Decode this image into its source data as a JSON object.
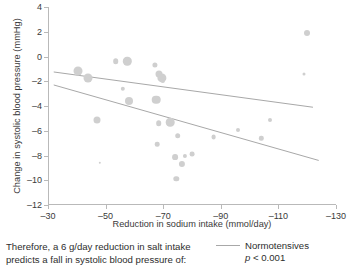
{
  "chart_data": {
    "type": "scatter",
    "title": "",
    "xlabel": "Reduction in sodium intake (mmol/day)",
    "ylabel": "Change in systolic blood pressure (mmHg)",
    "xlim": [
      -30,
      -130
    ],
    "ylim": [
      -12,
      4
    ],
    "x_ticks": [
      -30,
      -50,
      -70,
      -90,
      -110,
      -130
    ],
    "y_ticks": [
      4,
      2,
      0,
      -2,
      -4,
      -6,
      -8,
      -10,
      -12
    ],
    "x_tick_labels": [
      "–30",
      "–50",
      "–70",
      "–90",
      "–110",
      "–130"
    ],
    "y_tick_labels": [
      "4",
      "2",
      "0",
      "–2",
      "–4",
      "–6",
      "–8",
      "–10",
      "–12"
    ],
    "grid": false,
    "legend_position": "bottom-right",
    "marker_color": "#cfcfcf",
    "line_color": "#a8a8a8",
    "axis_color": "#b9b9b9",
    "points": [
      {
        "x": -40.5,
        "y": -1.2,
        "size": 9.0
      },
      {
        "x": -44.0,
        "y": -1.7,
        "size": 9.0
      },
      {
        "x": -47.0,
        "y": -5.1,
        "size": 7.0
      },
      {
        "x": -48.0,
        "y": -8.6,
        "size": 2.4
      },
      {
        "x": -53.5,
        "y": -0.4,
        "size": 5.6
      },
      {
        "x": -56.0,
        "y": -2.6,
        "size": 4.4
      },
      {
        "x": -57.5,
        "y": -0.4,
        "size": 8.4
      },
      {
        "x": -58.0,
        "y": -3.6,
        "size": 8.0
      },
      {
        "x": -67.5,
        "y": -3.5,
        "size": 8.6
      },
      {
        "x": -67.0,
        "y": -0.7,
        "size": 5.2
      },
      {
        "x": -68.5,
        "y": -1.4,
        "size": 7.0
      },
      {
        "x": -69.5,
        "y": -1.7,
        "size": 9.2
      },
      {
        "x": -70.0,
        "y": -2.0,
        "size": 4.2
      },
      {
        "x": -68.5,
        "y": -5.4,
        "size": 5.6
      },
      {
        "x": -68.0,
        "y": -7.1,
        "size": 4.6
      },
      {
        "x": -72.5,
        "y": -5.3,
        "size": 8.6
      },
      {
        "x": -75.0,
        "y": -6.4,
        "size": 5.6
      },
      {
        "x": -74.0,
        "y": -8.1,
        "size": 5.8
      },
      {
        "x": -76.5,
        "y": -8.7,
        "size": 6.2
      },
      {
        "x": -77.5,
        "y": -8.0,
        "size": 4.2
      },
      {
        "x": -80.0,
        "y": -7.9,
        "size": 4.8
      },
      {
        "x": -74.5,
        "y": -9.9,
        "size": 5.4
      },
      {
        "x": -87.5,
        "y": -6.5,
        "size": 4.8
      },
      {
        "x": -96.0,
        "y": -5.9,
        "size": 4.0
      },
      {
        "x": -104.0,
        "y": -6.6,
        "size": 4.4
      },
      {
        "x": -107.0,
        "y": -5.1,
        "size": 4.0
      },
      {
        "x": -120.0,
        "y": 1.9,
        "size": 6.0
      },
      {
        "x": -119.0,
        "y": -1.4,
        "size": 3.0
      }
    ],
    "series": [
      {
        "name": "Normotensives",
        "type": "regression-line",
        "x_start": -32.0,
        "y_start": -1.25,
        "x_end": -122.0,
        "y_end": -4.1
      },
      {
        "name": "Hypertensives",
        "type": "regression-line",
        "x_start": -32.0,
        "y_start": -2.3,
        "x_end": -124.0,
        "y_end": -8.4
      }
    ],
    "legend": [
      {
        "label": "Normotensives",
        "swatch": "line",
        "color": "#a8a8a8"
      }
    ],
    "annotations": [
      {
        "text": "p < 0.001",
        "p_italic": "p",
        "rest": " < 0.001"
      }
    ]
  },
  "caption": {
    "line1": "Therefore, a 6 g/day reduction in salt intake",
    "line2": "predicts a fall in systolic blood pressure of:"
  },
  "legend": {
    "series_label": "Normotensives",
    "p_symbol": "p",
    "p_rest": " < 0.001"
  }
}
